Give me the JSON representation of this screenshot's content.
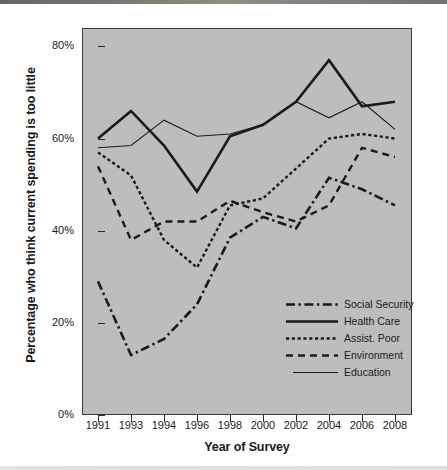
{
  "chart_data": {
    "type": "line",
    "title": "",
    "xlabel": "Year of Survey",
    "ylabel": "Percentage who think current spending is too little",
    "categories": [
      "1991",
      "1993",
      "1994",
      "1996",
      "1998",
      "2000",
      "2002",
      "2004",
      "2006",
      "2008"
    ],
    "x": [
      1991,
      1993,
      1994,
      1996,
      1998,
      2000,
      2002,
      2004,
      2006,
      2008
    ],
    "ylim": [
      0,
      84
    ],
    "xlim_categorical": true,
    "grid": false,
    "legend_position": "bottom-right-inside",
    "yticks": [
      0,
      20,
      40,
      60,
      80
    ],
    "ytick_labels": [
      "0%",
      "20%",
      "40%",
      "60%",
      "80%"
    ],
    "panel_background": "#bdbdbd",
    "series": [
      {
        "name": "Social Security",
        "style": "dash-dot",
        "width": 2.6,
        "color": "#1a1a1a",
        "values": [
          29,
          13,
          16.5,
          24,
          38.5,
          43,
          40.5,
          51.5,
          49,
          45.5
        ]
      },
      {
        "name": "Health Care",
        "style": "solid",
        "width": 2.6,
        "color": "#1a1a1a",
        "values": [
          60,
          66,
          58.5,
          48.5,
          60.5,
          63,
          68,
          77,
          67,
          68
        ]
      },
      {
        "name": "Assist. Poor",
        "style": "dotted",
        "width": 2.4,
        "color": "#1a1a1a",
        "values": [
          57,
          52,
          38,
          32,
          45.5,
          47,
          53.5,
          60,
          61,
          60
        ]
      },
      {
        "name": "Environment",
        "style": "dashed",
        "width": 2.4,
        "color": "#1a1a1a",
        "values": [
          54,
          38,
          42,
          42,
          46.5,
          44,
          42,
          45.5,
          58,
          56
        ]
      },
      {
        "name": "Education",
        "style": "solid-thin",
        "width": 1.1,
        "color": "#1a1a1a",
        "values": [
          58,
          58.5,
          64,
          60.5,
          61,
          63,
          68,
          64.5,
          68,
          62
        ]
      }
    ]
  },
  "axis": {
    "ytick_labels": [
      "80%",
      "60%",
      "40%",
      "20%",
      "0%"
    ],
    "xtick_labels": [
      "1991",
      "1993",
      "1994",
      "1996",
      "1998",
      "2000",
      "2002",
      "2004",
      "2006",
      "2008"
    ],
    "xlabel": "Year of Survey",
    "ylabel": "Percentage who think current spending is too little"
  },
  "legend": {
    "items": [
      {
        "label": "Social Security",
        "key": "dash-dot"
      },
      {
        "label": "Health Care",
        "key": "solid"
      },
      {
        "label": "Assist. Poor",
        "key": "dotted"
      },
      {
        "label": "Environment",
        "key": "dashed"
      },
      {
        "label": "Education",
        "key": "solid-thin"
      }
    ]
  }
}
